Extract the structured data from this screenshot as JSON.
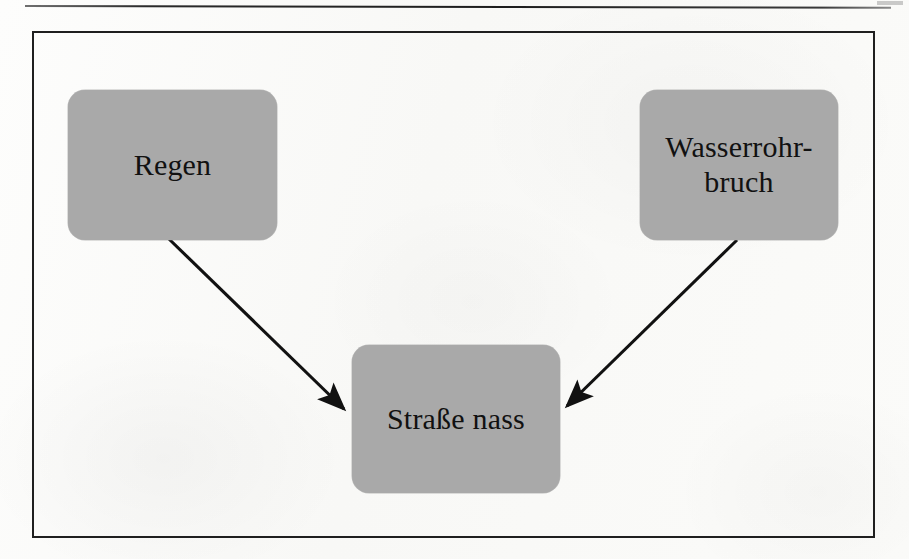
{
  "page": {
    "background_color": "#fbfbf9",
    "rule_color": "#1d1d1d",
    "frame_color": "#1f1f1f"
  },
  "diagram": {
    "type": "causal-graph",
    "node_fill_color": "#a9a9a9",
    "node_text_color": "#111111",
    "edge_color": "#111111",
    "nodes": [
      {
        "id": "rain",
        "label": "Regen"
      },
      {
        "id": "pipe",
        "label": "Wasserrohr-\nbruch"
      },
      {
        "id": "wet",
        "label": "Straße nass"
      }
    ],
    "edges": [
      {
        "from": "rain",
        "to": "wet",
        "style": "solid-arrow"
      },
      {
        "from": "pipe",
        "to": "wet",
        "style": "solid-arrow"
      }
    ]
  }
}
